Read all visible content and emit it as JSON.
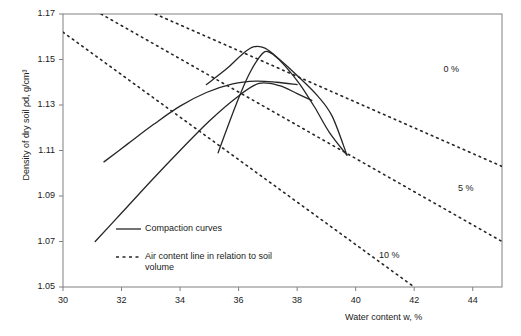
{
  "chart_data": {
    "type": "line",
    "title": "",
    "xlabel": "Water content w, %",
    "ylabel": "Density of dry soil ρd, g/cm³",
    "xlim": [
      30,
      45
    ],
    "ylim": [
      1.05,
      1.17
    ],
    "xticks": [
      30,
      32,
      34,
      36,
      38,
      40,
      42,
      44
    ],
    "xticklabels": [
      "30",
      "32",
      "34",
      "36",
      "38",
      "40",
      "42",
      "44"
    ],
    "yticks": [
      1.05,
      1.07,
      1.09,
      1.11,
      1.13,
      1.15,
      1.17
    ],
    "yticklabels": [
      "1.05",
      "1.07",
      "1.09",
      "1.11",
      "1.13",
      "1.15",
      "1.17"
    ],
    "grid": false,
    "legend_position": "inside-lower-left",
    "series": [
      {
        "name": "Compaction curve 1",
        "style": "solid",
        "points": [
          [
            31.4,
            1.105
          ],
          [
            32.2,
            1.1128
          ],
          [
            33.1,
            1.1215
          ],
          [
            34.0,
            1.1295
          ],
          [
            34.9,
            1.1355
          ],
          [
            35.8,
            1.1393
          ],
          [
            36.6,
            1.1405
          ],
          [
            37.3,
            1.14
          ],
          [
            38.0,
            1.139
          ]
        ]
      },
      {
        "name": "Compaction curve 2",
        "style": "solid",
        "points": [
          [
            31.1,
            1.07
          ],
          [
            32.0,
            1.0825
          ],
          [
            33.0,
            1.0965
          ],
          [
            34.0,
            1.11
          ],
          [
            35.0,
            1.123
          ],
          [
            36.0,
            1.134
          ],
          [
            36.7,
            1.1395
          ],
          [
            37.4,
            1.1385
          ],
          [
            38.0,
            1.135
          ],
          [
            38.5,
            1.132
          ]
        ]
      },
      {
        "name": "Compaction curve 3",
        "style": "solid",
        "points": [
          [
            34.9,
            1.139
          ],
          [
            35.6,
            1.146
          ],
          [
            36.1,
            1.152
          ],
          [
            36.5,
            1.1555
          ],
          [
            36.9,
            1.155
          ],
          [
            37.4,
            1.15
          ],
          [
            38.0,
            1.143
          ],
          [
            38.7,
            1.134
          ],
          [
            39.2,
            1.125
          ],
          [
            39.7,
            1.108
          ]
        ]
      },
      {
        "name": "Compaction curve 4",
        "style": "solid",
        "points": [
          [
            35.3,
            1.109
          ],
          [
            35.7,
            1.123
          ],
          [
            36.0,
            1.133
          ],
          [
            36.3,
            1.142
          ],
          [
            36.6,
            1.149
          ],
          [
            36.9,
            1.1535
          ],
          [
            37.2,
            1.152
          ],
          [
            37.6,
            1.147
          ],
          [
            38.1,
            1.139
          ],
          [
            38.6,
            1.129
          ],
          [
            39.1,
            1.118
          ],
          [
            39.7,
            1.108
          ]
        ]
      },
      {
        "name": "Air content line 0 %",
        "style": "dotted",
        "label": "0 %",
        "points": [
          [
            33.15,
            1.17
          ],
          [
            45.0,
            1.103
          ]
        ]
      },
      {
        "name": "Air content line 5 %",
        "style": "dotted",
        "label": "5 %",
        "points": [
          [
            31.3,
            1.17
          ],
          [
            45.0,
            1.07
          ]
        ]
      },
      {
        "name": "Air content line 10 %",
        "style": "dotted",
        "label": "10 %",
        "points": [
          [
            30.0,
            1.162
          ],
          [
            42.0,
            1.05
          ]
        ]
      }
    ],
    "annotations": [
      {
        "text": "0 %",
        "x": 43.0,
        "y": 1.1455
      },
      {
        "text": "5 %",
        "x": 43.5,
        "y": 1.093
      },
      {
        "text": "10 %",
        "x": 40.8,
        "y": 1.0635
      }
    ],
    "legend": [
      {
        "label": "Compaction curves",
        "style": "solid"
      },
      {
        "label": "Air content line in relation to soil\nvolume",
        "style": "dotted"
      }
    ],
    "colors": {
      "line": "#262626",
      "axis": "#808080",
      "text": "#1a1a1a"
    }
  }
}
